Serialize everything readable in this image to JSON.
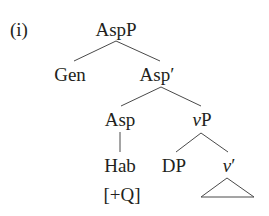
{
  "example_label": "(i)",
  "tree": {
    "root": "AspP",
    "nodes": {
      "aspp": "AspP",
      "gen": "Gen",
      "asp_bar": "Asp′",
      "asp": "Asp",
      "vp_v": "v",
      "vp_p": "P",
      "hab": "Hab",
      "feature": "[+Q]",
      "dp": "DP",
      "vbar_v": "v",
      "vbar_prime": "′"
    },
    "edges": [
      [
        "AspP",
        "Gen"
      ],
      [
        "AspP",
        "Asp′"
      ],
      [
        "Asp′",
        "Asp"
      ],
      [
        "Asp′",
        "vP"
      ],
      [
        "Asp",
        "Hab"
      ],
      [
        "vP",
        "DP"
      ],
      [
        "vP",
        "v′"
      ]
    ],
    "collapsed_nodes": [
      "v′"
    ]
  }
}
